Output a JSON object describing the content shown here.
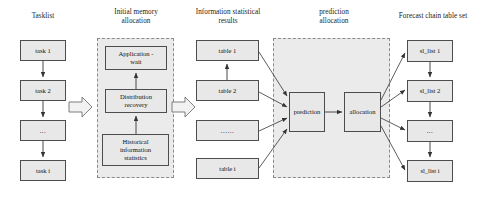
{
  "figure": {
    "type": "block-flow-diagram",
    "background": "#ffffff",
    "node_fill": "#e8e8e8",
    "node_stroke": "#4d4d4d",
    "group_fill": "#ebebeb",
    "group_stroke": "#8a8a8a",
    "connector_color": "#333333"
  },
  "columns": {
    "tasklist": {
      "title": "Tasklist",
      "nodes": [
        {
          "label": "task 1"
        },
        {
          "label": "task 2"
        },
        {
          "label": "..."
        },
        {
          "label": "task i"
        }
      ]
    },
    "initial_memory_allocation": {
      "title_line1": "Initial memory",
      "title_line2": "allocation",
      "nodes": [
        {
          "label_line1": "Application -",
          "label_line2": "wait"
        },
        {
          "label_line1": "Distribution",
          "label_line2": "recovery"
        },
        {
          "label_line1": "Historical",
          "label_line2": "information",
          "label_line3": "statistics"
        }
      ]
    },
    "information_statistical_results": {
      "title_line1": "Information statistical",
      "title_line2": "results",
      "nodes": [
        {
          "label": "table 1"
        },
        {
          "label": "table 2"
        },
        {
          "label": "......"
        },
        {
          "label": "table i"
        }
      ]
    },
    "prediction_allocation": {
      "title_line1": "prediction",
      "title_line2": "allocation",
      "nodes": [
        {
          "label": "prediction"
        },
        {
          "label": "allocation"
        }
      ]
    },
    "forecast_chain_table_set": {
      "title": "Forecast chain table set",
      "nodes": [
        {
          "label": "sl_list 1"
        },
        {
          "label": "sl_list 2"
        },
        {
          "label": "..."
        },
        {
          "label": "sl_list i"
        }
      ]
    }
  },
  "connectors": {
    "stage_arrow_1": "block-arrow-right",
    "stage_arrow_2": "block-arrow-right"
  }
}
